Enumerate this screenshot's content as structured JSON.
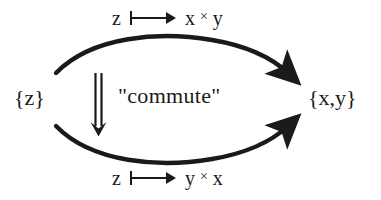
{
  "diagram": {
    "background_color": "#ffffff",
    "ink_color": "#1a1a1a",
    "nodes": {
      "source": {
        "label": "{z}"
      },
      "target": {
        "label": "{x,y}"
      }
    },
    "edges": {
      "top": {
        "name": "upper-curved-arrow",
        "from": "{z}",
        "to": "{x,y}",
        "label_input": "z",
        "label_mapsto_icon": "mapsto-arrow-icon",
        "label_output_first": "x",
        "label_output_times": "×",
        "label_output_second": "y",
        "label_text": "z ⟼ x × y"
      },
      "bottom": {
        "name": "lower-curved-arrow",
        "from": "{z}",
        "to": "{x,y}",
        "label_input": "z",
        "label_mapsto_icon": "mapsto-arrow-icon",
        "label_output_first": "y",
        "label_output_times": "×",
        "label_output_second": "x",
        "label_text": "z ⟼ y × x"
      }
    },
    "center": {
      "double_arrow_icon": "double-down-arrow-icon",
      "annotation": "\"commute\""
    }
  }
}
